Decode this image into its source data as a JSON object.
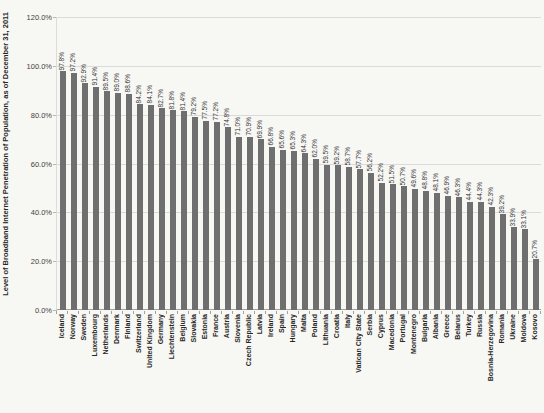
{
  "page": {
    "background_color": "#f7f7f3"
  },
  "chart_data": {
    "type": "bar",
    "title": "",
    "ylabel": "Level of Broadband Internet Penetration of Population, as of December 31, 2011",
    "xlabel": "",
    "ylim": [
      0,
      120
    ],
    "ytick_values": [
      0,
      20,
      40,
      60,
      80,
      100,
      120
    ],
    "ytick_labels": [
      "0.0%",
      "20.0%",
      "40.0%",
      "60.0%",
      "80.0%",
      "100.0%",
      "120.0%"
    ],
    "grid": true,
    "legend": false,
    "bar_color": "#6f6f6f",
    "value_label_suffix": "%",
    "categories": [
      "Iceland",
      "Norway",
      "Sweden",
      "Luxembourg",
      "Netherlands",
      "Denmark",
      "Finland",
      "Switzerland",
      "United Kingdom",
      "Germany",
      "Liechtenstein",
      "Belgium",
      "Slovakia",
      "Estonia",
      "France",
      "Austria",
      "Slovenia",
      "Czech Republic",
      "Latvia",
      "Ireland",
      "Spain",
      "Hungary",
      "Malta",
      "Poland",
      "Lithuania",
      "Croatia",
      "Italy",
      "Vatican City State",
      "Serbia",
      "Cyprus",
      "Macedonia",
      "Portugal",
      "Montenegro",
      "Bulgaria",
      "Albania",
      "Greece",
      "Belarus",
      "Turkey",
      "Russia",
      "Bosnia-Herzegovina",
      "Romania",
      "Ukraine",
      "Moldova",
      "Kosovo"
    ],
    "values": [
      97.8,
      97.2,
      92.9,
      91.4,
      89.5,
      89.0,
      88.6,
      84.2,
      84.1,
      82.7,
      81.8,
      81.4,
      79.2,
      77.5,
      77.2,
      74.8,
      71.0,
      70.9,
      69.9,
      66.8,
      65.6,
      65.3,
      64.3,
      62.0,
      59.5,
      59.2,
      58.7,
      57.7,
      56.2,
      52.2,
      51.5,
      50.7,
      49.6,
      48.8,
      48.1,
      46.9,
      46.3,
      44.4,
      44.3,
      42.3,
      39.2,
      33.9,
      33.1,
      20.7
    ]
  }
}
